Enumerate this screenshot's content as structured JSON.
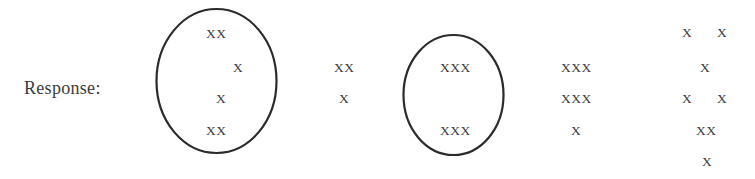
{
  "label": {
    "text": "Response:"
  },
  "ellipses": [
    {
      "cx": 216.5,
      "cy": 81,
      "rx": 60,
      "ry": 72,
      "stroke": "#2b2b2b"
    },
    {
      "cx": 453.5,
      "cy": 95,
      "rx": 50,
      "ry": 60,
      "stroke": "#2b2b2b"
    }
  ],
  "columns": [
    {
      "name": "column-1",
      "circled": true,
      "marks": [
        {
          "text": "XX",
          "x": 206,
          "y": 34
        },
        {
          "text": "X",
          "x": 233,
          "y": 68
        },
        {
          "text": "X",
          "x": 216,
          "y": 99
        },
        {
          "text": "XX",
          "x": 206,
          "y": 131
        }
      ]
    },
    {
      "name": "column-2",
      "circled": false,
      "marks": [
        {
          "text": "XX",
          "x": 334,
          "y": 68
        },
        {
          "text": "X",
          "x": 339,
          "y": 99
        }
      ]
    },
    {
      "name": "column-3",
      "circled": true,
      "marks": [
        {
          "text": "XXX",
          "x": 440,
          "y": 68
        },
        {
          "text": "XXX",
          "x": 440,
          "y": 131
        }
      ]
    },
    {
      "name": "column-4",
      "circled": false,
      "marks": [
        {
          "text": "XXX",
          "x": 561,
          "y": 68
        },
        {
          "text": "XXX",
          "x": 561,
          "y": 99
        },
        {
          "text": "X",
          "x": 571,
          "y": 131
        }
      ]
    },
    {
      "name": "column-5",
      "circled": false,
      "marks": [
        {
          "text": "X",
          "x": 682,
          "y": 33
        },
        {
          "text": "X",
          "x": 717,
          "y": 33
        },
        {
          "text": "X",
          "x": 700,
          "y": 68
        },
        {
          "text": "X",
          "x": 682,
          "y": 99
        },
        {
          "text": "X",
          "x": 717,
          "y": 99
        },
        {
          "text": "XX",
          "x": 696,
          "y": 131
        },
        {
          "text": "X",
          "x": 702,
          "y": 162
        }
      ]
    }
  ]
}
